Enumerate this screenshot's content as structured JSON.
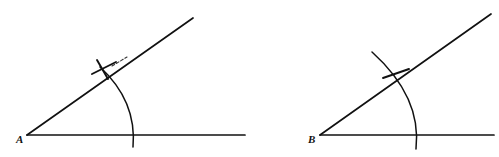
{
  "figure": {
    "background_color": "#ffffff",
    "stroke_color": "#111111",
    "width": 499,
    "height": 157,
    "panels": [
      {
        "id": "panel-left",
        "vertex_label": "A",
        "vertex_label_x": 16,
        "vertex_label_y": 141,
        "vertex": {
          "x": 27,
          "y": 135
        },
        "horizontal_ray_end": {
          "x": 245,
          "y": 135
        },
        "upper_ray_end": {
          "x": 193,
          "y": 18
        },
        "arc": {
          "start": {
            "x": 100,
            "y": 67
          },
          "end": {
            "x": 133,
            "y": 147
          },
          "radius": 82,
          "bulge_control": {
            "x": 133,
            "y": 100
          }
        },
        "arc_horizontal_crossing": {
          "x": 133,
          "y": 135
        },
        "arc_ray_intersection": {
          "x": 103,
          "y": 70
        },
        "tick_marks": [
          {
            "name": "tick-cross-1",
            "x1": 92,
            "y1": 74,
            "x2": 116,
            "y2": 62
          },
          {
            "name": "tick-cross-2",
            "x1": 97,
            "y1": 60,
            "x2": 108,
            "y2": 79
          }
        ],
        "dashed_segment": {
          "x1": 112,
          "y1": 66,
          "x2": 126,
          "y2": 57
        }
      },
      {
        "id": "panel-right",
        "vertex_label": "B",
        "vertex_label_x": 309,
        "vertex_label_y": 141,
        "vertex": {
          "x": 320,
          "y": 135
        },
        "horizontal_ray_end": {
          "x": 494,
          "y": 135
        },
        "upper_ray_end": {
          "x": 491,
          "y": 14
        },
        "arc": {
          "start": {
            "x": 372,
            "y": 52
          },
          "end": {
            "x": 416,
            "y": 149
          },
          "radius": 98,
          "bulge_control": {
            "x": 418,
            "y": 96
          }
        },
        "arc_horizontal_crossing": {
          "x": 415,
          "y": 135
        },
        "arc_ray_intersection": {
          "x": 394,
          "y": 73
        },
        "tick_marks": [
          {
            "name": "tick-cross-1",
            "x1": 383,
            "y1": 78,
            "x2": 408,
            "y2": 69
          }
        ],
        "dashed_segment": null
      }
    ]
  }
}
